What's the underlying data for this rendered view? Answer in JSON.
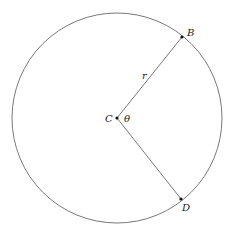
{
  "diagram": {
    "circle": {
      "cx": 117,
      "cy": 118,
      "r": 105,
      "stroke": "#555555"
    },
    "center": {
      "label": "C",
      "x": 117,
      "y": 118
    },
    "points": [
      {
        "label": "B",
        "x": 182,
        "y": 37
      },
      {
        "label": "D",
        "x": 181,
        "y": 199
      }
    ],
    "radius_label": "r",
    "angle_label": "θ"
  }
}
